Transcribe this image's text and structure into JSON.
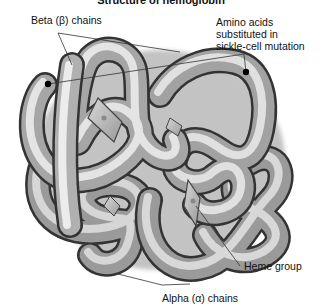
{
  "figure": {
    "title": "Structure of hemoglobin",
    "labels": {
      "beta_chains": "Beta (β) chains",
      "amino_line1": "Amino acids",
      "amino_line2": "substituted in",
      "amino_line3": "sickle-cell mutation",
      "heme_group": "Heme group",
      "alpha_chains": "Alpha (α) chains"
    },
    "colors": {
      "tube_light": "#e6e6e6",
      "tube_mid": "#a8a8a8",
      "tube_dark": "#4a4a4a",
      "heme_plate": "#c4c4c4",
      "leader_line": "#333333",
      "mutation_dot": "#000000"
    }
  }
}
